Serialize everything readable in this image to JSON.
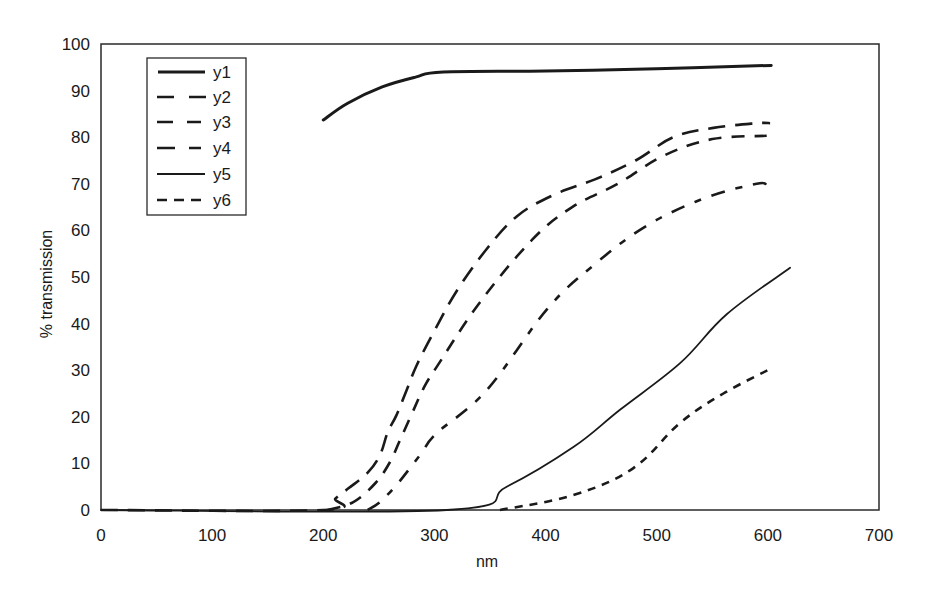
{
  "chart_data": {
    "type": "line",
    "title": "",
    "xlabel": "nm",
    "ylabel": "% transmission",
    "xlim": [
      0,
      700
    ],
    "ylim": [
      0,
      100
    ],
    "x_ticks": [
      0,
      100,
      200,
      300,
      400,
      500,
      600,
      700
    ],
    "y_ticks": [
      0,
      10,
      20,
      30,
      40,
      50,
      60,
      70,
      80,
      90,
      100
    ],
    "grid": false,
    "legend_position": "upper-left-inside",
    "series": [
      {
        "name": "y1",
        "style": "solid-thick",
        "points": [
          [
            200,
            83.7
          ],
          [
            222,
            87.3
          ],
          [
            253,
            90.8
          ],
          [
            283,
            92.9
          ],
          [
            308,
            94.0
          ],
          [
            400,
            94.2
          ],
          [
            500,
            94.7
          ],
          [
            603,
            95.4
          ]
        ]
      },
      {
        "name": "y2",
        "style": "long-dash",
        "points": [
          [
            0,
            0
          ],
          [
            200,
            0
          ],
          [
            211,
            2.5
          ],
          [
            223,
            4.7
          ],
          [
            240,
            8.0
          ],
          [
            251,
            11.8
          ],
          [
            258,
            16.7
          ],
          [
            266,
            20.4
          ],
          [
            275,
            25.7
          ],
          [
            284,
            31.0
          ],
          [
            299,
            38.0
          ],
          [
            320,
            47.0
          ],
          [
            347,
            56.0
          ],
          [
            374,
            63.0
          ],
          [
            407,
            67.6
          ],
          [
            445,
            71.0
          ],
          [
            481,
            75.0
          ],
          [
            515,
            80.0
          ],
          [
            551,
            82.0
          ],
          [
            590,
            83.0
          ],
          [
            602,
            83.0
          ]
        ]
      },
      {
        "name": "y3",
        "style": "medium-dash",
        "points": [
          [
            204,
            0
          ],
          [
            227,
            1.7
          ],
          [
            247,
            5.8
          ],
          [
            260,
            10.3
          ],
          [
            269,
            15.0
          ],
          [
            280,
            20.8
          ],
          [
            290,
            26.0
          ],
          [
            302,
            30.7
          ],
          [
            341,
            44.6
          ],
          [
            388,
            58.0
          ],
          [
            424,
            65.0
          ],
          [
            465,
            70.0
          ],
          [
            506,
            76.0
          ],
          [
            550,
            79.6
          ],
          [
            599,
            80.3
          ]
        ]
      },
      {
        "name": "y4",
        "style": "dash-dot",
        "points": [
          [
            240,
            0
          ],
          [
            251,
            1.7
          ],
          [
            266,
            5.4
          ],
          [
            278,
            9.0
          ],
          [
            289,
            12.4
          ],
          [
            302,
            16.5
          ],
          [
            347,
            25.7
          ],
          [
            401,
            43.0
          ],
          [
            443,
            52.5
          ],
          [
            491,
            61.0
          ],
          [
            544,
            67.0
          ],
          [
            590,
            70.0
          ],
          [
            599,
            69.7
          ]
        ]
      },
      {
        "name": "y5",
        "style": "solid-thin",
        "points": [
          [
            0,
            0
          ],
          [
            311,
            0
          ],
          [
            365,
            5.0
          ],
          [
            425,
            13.5
          ],
          [
            467,
            21.5
          ],
          [
            521,
            31.5
          ],
          [
            563,
            42.0
          ],
          [
            620,
            52.0
          ]
        ]
      },
      {
        "name": "y6",
        "style": "short-dash",
        "points": [
          [
            359,
            0
          ],
          [
            425,
            3.2
          ],
          [
            479,
            9.0
          ],
          [
            521,
            18.7
          ],
          [
            560,
            25.0
          ],
          [
            604,
            30.5
          ]
        ]
      }
    ]
  },
  "plot": {
    "x_axis_label": "nm",
    "y_axis_label": "% transmission",
    "x_tick_labels": [
      "0",
      "100",
      "200",
      "300",
      "400",
      "500",
      "600",
      "700"
    ],
    "y_tick_labels": [
      "0",
      "10",
      "20",
      "30",
      "40",
      "50",
      "60",
      "70",
      "80",
      "90",
      "100"
    ],
    "line_color": "#1a1a1a",
    "background": "#ffffff"
  },
  "legend": {
    "items": [
      {
        "label": "y1"
      },
      {
        "label": "y2"
      },
      {
        "label": "y3"
      },
      {
        "label": "y4"
      },
      {
        "label": "y5"
      },
      {
        "label": "y6"
      }
    ]
  }
}
